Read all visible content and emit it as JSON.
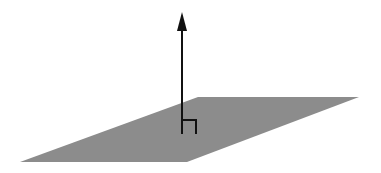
{
  "diagram": {
    "plane": {
      "fill": "#8c8c8c",
      "label": ""
    },
    "normal_vector": {
      "stroke": "#111111",
      "label": ""
    },
    "right_angle_marker": {
      "stroke": "#111111"
    }
  }
}
